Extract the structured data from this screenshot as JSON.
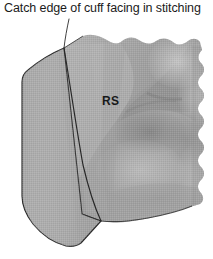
{
  "figure": {
    "kind": "sewing-instruction-illustration",
    "width": 213,
    "height": 259,
    "background_color": "#ffffff"
  },
  "caption": {
    "text": "Catch edge of cuff facing in stitching",
    "leader_line": {
      "from_x": 69,
      "from_y": 19,
      "to_x": 64,
      "to_y": 49,
      "color": "#2b2b2b"
    }
  },
  "labels": [
    {
      "id": "right-side",
      "text": "RS",
      "x": 102,
      "y": 94,
      "color": "#17191a"
    }
  ],
  "colors": {
    "fabric_base": "#a9a9a9",
    "fabric_light": "#c3c3c3",
    "fabric_mid": "#a3a3a3",
    "fabric_shadow": "#8c8c8c",
    "fabric_deep_shadow": "#7b7b7b",
    "outline": "#2a2a2a",
    "stitch_line": "#272727",
    "paper": "#ffffff",
    "text": "#1b1b1b"
  },
  "regions": [
    {
      "id": "cuff-panel",
      "name": "cuff-panel",
      "description": "flat gray cuff band on the left with rounded corners",
      "fill": "#a9a9a9"
    },
    {
      "id": "sleeve-fabric",
      "name": "gathered-sleeve-fabric",
      "description": "draped gathered fabric at right with scalloped raw edge and soft folds",
      "fill": "#a5a5a5"
    }
  ],
  "stitching": {
    "style": "solid-thin-dark",
    "description": "seam line joining cuff to sleeve, runs from top edge down to lower right"
  }
}
